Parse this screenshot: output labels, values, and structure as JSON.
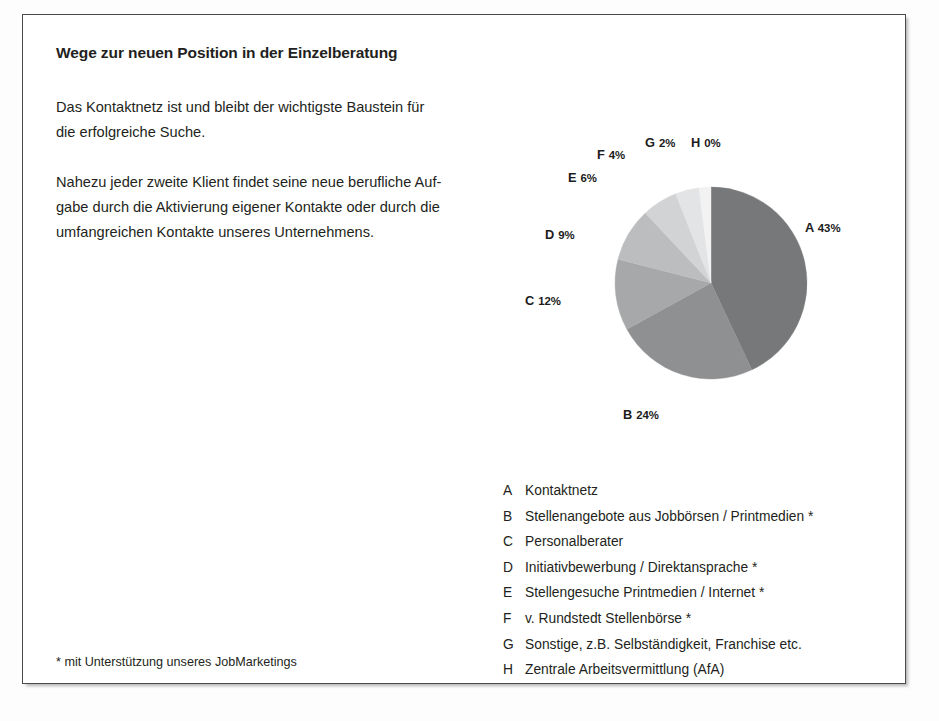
{
  "document": {
    "title": "Wege zur neuen Position in der Einzelberatung",
    "paragraphs": [
      "Das Kontaktnetz ist und bleibt der wichtigste Baustein für die erfolgreiche Suche.",
      "Nahezu jeder zweite Klient findet seine neue berufliche Auf-gabe durch die Aktivierung eigener Kontakte oder durch die umfangreichen Kontakte unseres Unternehmens."
    ],
    "paragraph1_lines": [
      "Das Kontaktnetz ist und bleibt der wichtigste Baustein für",
      "die erfolgreiche Suche."
    ],
    "paragraph2_lines": [
      "Nahezu jeder zweite Klient findet seine neue berufliche Auf-",
      "gabe durch die Aktivierung eigener Kontakte oder durch die",
      "umfangreichen Kontakte unseres Unternehmens."
    ],
    "footnote": "* mit Unterstützung unseres JobMarketings"
  },
  "chart_data": {
    "type": "pie",
    "title": "Wege zur neuen Position in der Einzelberatung",
    "legend_position": "below",
    "start_angle_deg": 0,
    "direction": "clockwise",
    "categories": [
      "A",
      "B",
      "C",
      "D",
      "E",
      "F",
      "G",
      "H"
    ],
    "values": [
      43,
      24,
      12,
      9,
      6,
      4,
      2,
      0
    ],
    "value_unit": "%",
    "labels": [
      {
        "key": "A",
        "pct": "43%",
        "label_text": "A 43%"
      },
      {
        "key": "B",
        "pct": "24%",
        "label_text": "B 24%"
      },
      {
        "key": "C",
        "pct": "12%",
        "label_text": "C 12%"
      },
      {
        "key": "D",
        "pct": "9%",
        "label_text": "D 9%"
      },
      {
        "key": "E",
        "pct": "6%",
        "label_text": "E 6%"
      },
      {
        "key": "F",
        "pct": "4%",
        "label_text": "F 4%"
      },
      {
        "key": "G",
        "pct": "2%",
        "label_text": "G 2%"
      },
      {
        "key": "H",
        "pct": "0%",
        "label_text": "H 0%"
      }
    ],
    "colors": [
      "#77787a",
      "#8f9092",
      "#a7a8aa",
      "#bcbdbf",
      "#d2d3d5",
      "#e3e4e5",
      "#f2f2f2",
      "#fafafa"
    ],
    "legend": [
      {
        "key": "A",
        "label": "Kontaktnetz"
      },
      {
        "key": "B",
        "label": "Stellenangebote aus Jobbörsen / Printmedien *"
      },
      {
        "key": "C",
        "label": "Personalberater"
      },
      {
        "key": "D",
        "label": "Initiativbewerbung / Direktansprache *"
      },
      {
        "key": "E",
        "label": "Stellengesuche Printmedien / Internet *"
      },
      {
        "key": "F",
        "label": "v. Rundstedt Stellenbörse *"
      },
      {
        "key": "G",
        "label": "Sonstige, z.B. Selbständigkeit, Franchise etc."
      },
      {
        "key": "H",
        "label": "Zentrale Arbeitsvermittlung (AfA)"
      }
    ]
  }
}
